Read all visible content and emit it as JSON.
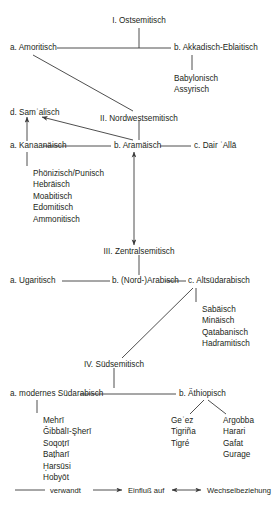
{
  "diagram": {
    "line_color": "#3b3b3b",
    "text_color": "#231f20",
    "nodes": {
      "ostsemitisch": "I. Ostsemitisch",
      "amoritisch": "a. Amoritisch",
      "akkadisch": "b. Akkadisch-Eblaitisch",
      "nordwestsemitisch": "II. Nordwestsemitisch",
      "samalisch": "d. Samʾalisch",
      "kanaanaeisch": "a. Kanaanäisch",
      "aramaeisch": "b. Aramäisch",
      "dair_alla": "c. Dair ʿAllā",
      "zentralsemitisch": "III. Zentralsemitisch",
      "ugaritisch": "a. Ugaritisch",
      "nordarabisch": "b. (Nord-)Arabisch",
      "altsuedarabisch": "c. Altsüdarabisch",
      "suedsemitisch": "IV. Südsemitisch",
      "modernes_suedarabisch": "a. modernes Südarabisch",
      "aethiopisch": "b. Äthiopisch"
    },
    "groups": {
      "akkadisch_children": [
        "Babylonisch",
        "Assyrisch"
      ],
      "kanaanaeisch_children": [
        "Phönizisch/Punisch",
        "Hebräisch",
        "Moabitisch",
        "Edomitisch",
        "Ammonitisch"
      ],
      "altsuedarabisch_children": [
        "Sabäisch",
        "Minäisch",
        "Qatabanisch",
        "Hadramitisch"
      ],
      "modernes_suedarabisch_children": [
        "Mehrī",
        "Ǧibbālī-Şherī",
        "Soqoṭrī",
        "Baṭharī",
        "Ḥarsūsi",
        "Hobyōt"
      ],
      "aethiopisch_north": [
        "Geʿez",
        "Tigriña",
        "Tigré"
      ],
      "aethiopisch_south": [
        "Argobba",
        "Harari",
        "Gafat",
        "Gurage"
      ]
    },
    "legend": [
      {
        "key": "verwandt",
        "label": "verwandt",
        "marker": "plain-line"
      },
      {
        "key": "einfluss",
        "label": "Einfluß auf",
        "marker": "single-arrow"
      },
      {
        "key": "wechsel",
        "label": "Wechselbeziehung",
        "marker": "double-arrow"
      }
    ]
  }
}
